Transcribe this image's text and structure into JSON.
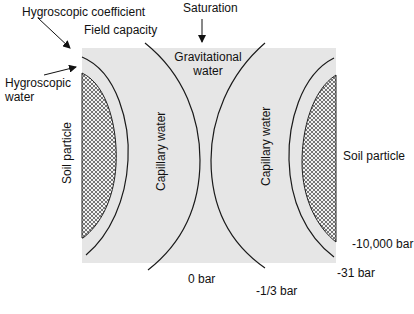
{
  "diagram": {
    "labels": {
      "hygroscopic_coefficient": "Hygroscopic coefficient",
      "field_capacity": "Field capacity",
      "saturation": "Saturation",
      "hygroscopic_water_line1": "Hygroscopic",
      "hygroscopic_water_line2": "water",
      "gravitational_water_line1": "Gravitational",
      "gravitational_water_line2": "water",
      "capillary_water_left": "Capillary water",
      "capillary_water_right": "Capillary water",
      "soil_particle_left": "Soil particle",
      "soil_particle_right": "Soil particle"
    },
    "potentials": {
      "p_10000": "-10,000 bar",
      "p_31": "-31 bar",
      "p_0": "0 bar",
      "p_third": "-1/3 bar"
    },
    "colors": {
      "background_zone": "#e6e6e6",
      "line": "#1a1a1a",
      "particle_hatch": "#555555",
      "particle_fill": "#f2f2f2"
    }
  }
}
